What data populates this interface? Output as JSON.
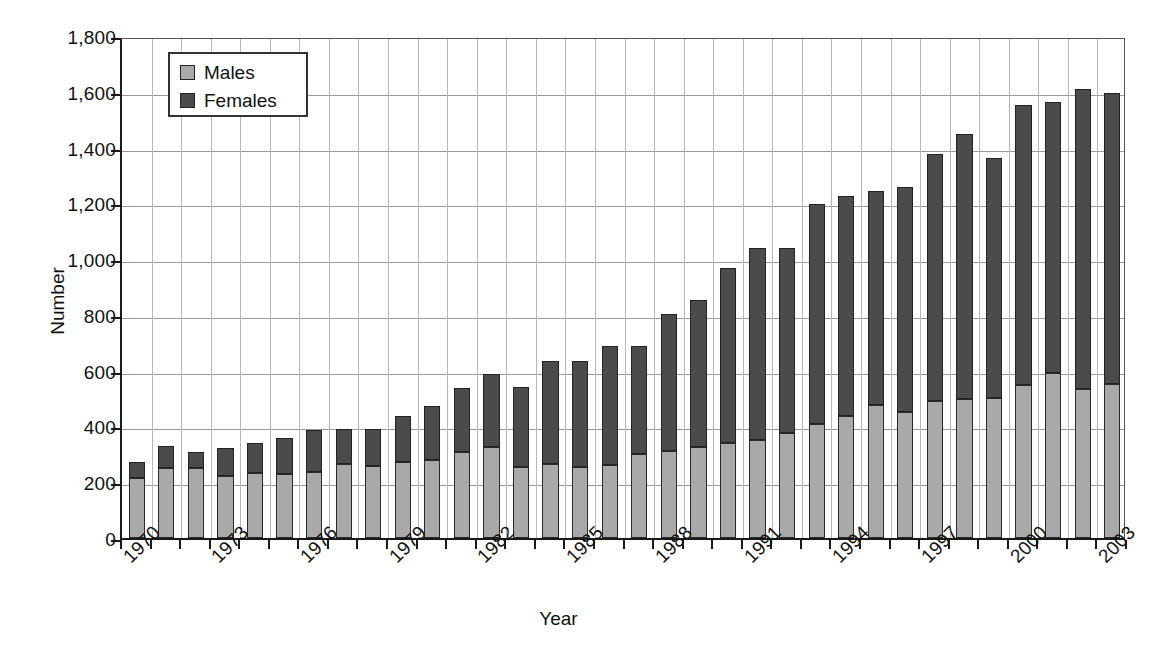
{
  "chart_data": {
    "type": "bar",
    "subtype": "stacked-bar",
    "title": "",
    "xlabel": "Year",
    "ylabel": "Number",
    "ylim": [
      0,
      1800
    ],
    "ytick_step": 200,
    "yticks": [
      "0",
      "200",
      "400",
      "600",
      "800",
      "1,000",
      "1,200",
      "1,400",
      "1,600",
      "1,800"
    ],
    "grid": true,
    "grid_axis": "both",
    "legend": {
      "position": "top-left-inside",
      "entries": [
        {
          "label": "Males",
          "color": "#a9a9a9"
        },
        {
          "label": "Females",
          "color": "#4b4b4b"
        }
      ]
    },
    "categories": [
      "1970",
      "1971",
      "1972",
      "1973",
      "1974",
      "1975",
      "1976",
      "1977",
      "1978",
      "1979",
      "1980",
      "1981",
      "1982",
      "1983",
      "1984",
      "1985",
      "1986",
      "1987",
      "1988",
      "1989",
      "1990",
      "1991",
      "1992",
      "1993",
      "1994",
      "1995",
      "1996",
      "1997",
      "1998",
      "1999",
      "2000",
      "2001",
      "2002",
      "2003"
    ],
    "xtick_labels_shown": [
      "1970",
      "1973",
      "1976",
      "1979",
      "1982",
      "1985",
      "1988",
      "1991",
      "1994",
      "1997",
      "2000",
      "2003"
    ],
    "series": [
      {
        "name": "Males",
        "color": "#a9a9a9",
        "values": [
          215,
          250,
          252,
          222,
          232,
          230,
          235,
          265,
          260,
          272,
          280,
          310,
          325,
          255,
          265,
          255,
          262,
          300,
          312,
          325,
          340,
          350,
          378,
          408,
          438,
          478,
          452,
          492,
          500,
          502,
          548,
          590,
          535,
          552
        ]
      },
      {
        "name": "Females",
        "color": "#4b4b4b",
        "values": [
          57,
          80,
          55,
          100,
          108,
          128,
          153,
          125,
          132,
          165,
          192,
          228,
          262,
          285,
          368,
          378,
          428,
          390,
          492,
          530,
          628,
          690,
          662,
          788,
          790,
          768,
          806,
          886,
          950,
          862,
          1004,
          975,
          1075,
          1042
        ]
      }
    ],
    "totals": [
      272,
      330,
      307,
      322,
      340,
      358,
      388,
      390,
      392,
      437,
      472,
      538,
      587,
      540,
      633,
      633,
      690,
      690,
      804,
      855,
      968,
      1040,
      1040,
      1196,
      1228,
      1246,
      1258,
      1378,
      1450,
      1364,
      1552,
      1565,
      1610,
      1594
    ]
  },
  "axis": {
    "ylabel": "Number",
    "xlabel": "Year"
  }
}
